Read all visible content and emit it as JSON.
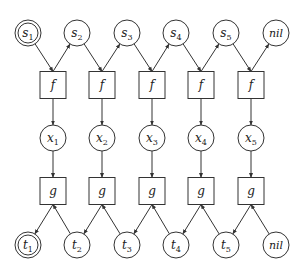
{
  "diagram": {
    "type": "factor-graph",
    "top_row": [
      {
        "id": "s1",
        "label": "s",
        "sub": "1",
        "double": true
      },
      {
        "id": "s2",
        "label": "s",
        "sub": "2",
        "double": false
      },
      {
        "id": "s3",
        "label": "s",
        "sub": "3",
        "double": false
      },
      {
        "id": "s4",
        "label": "s",
        "sub": "4",
        "double": false
      },
      {
        "id": "s5",
        "label": "s",
        "sub": "5",
        "double": false
      },
      {
        "id": "nil_top",
        "label": "nil",
        "sub": "",
        "double": false
      }
    ],
    "f_boxes": [
      {
        "id": "f1",
        "label": "f"
      },
      {
        "id": "f2",
        "label": "f"
      },
      {
        "id": "f3",
        "label": "f"
      },
      {
        "id": "f4",
        "label": "f"
      },
      {
        "id": "f5",
        "label": "f"
      }
    ],
    "middle_row": [
      {
        "id": "x1",
        "label": "x",
        "sub": "1"
      },
      {
        "id": "x2",
        "label": "x",
        "sub": "2"
      },
      {
        "id": "x3",
        "label": "x",
        "sub": "3"
      },
      {
        "id": "x4",
        "label": "x",
        "sub": "4"
      },
      {
        "id": "x5",
        "label": "x",
        "sub": "5"
      }
    ],
    "g_boxes": [
      {
        "id": "g1",
        "label": "g"
      },
      {
        "id": "g2",
        "label": "g"
      },
      {
        "id": "g3",
        "label": "g"
      },
      {
        "id": "g4",
        "label": "g"
      },
      {
        "id": "g5",
        "label": "g"
      }
    ],
    "bottom_row": [
      {
        "id": "t1",
        "label": "t",
        "sub": "1",
        "double": true
      },
      {
        "id": "t2",
        "label": "t",
        "sub": "2",
        "double": false
      },
      {
        "id": "t3",
        "label": "t",
        "sub": "3",
        "double": false
      },
      {
        "id": "t4",
        "label": "t",
        "sub": "4",
        "double": false
      },
      {
        "id": "t5",
        "label": "t",
        "sub": "5",
        "double": false
      },
      {
        "id": "nil_bottom",
        "label": "nil",
        "sub": "",
        "double": false
      }
    ],
    "edges": [
      {
        "from": "s1",
        "to": "f1"
      },
      {
        "from": "f1",
        "to": "s2"
      },
      {
        "from": "s2",
        "to": "f2"
      },
      {
        "from": "f2",
        "to": "s3"
      },
      {
        "from": "s3",
        "to": "f3"
      },
      {
        "from": "f3",
        "to": "s4"
      },
      {
        "from": "s4",
        "to": "f4"
      },
      {
        "from": "f4",
        "to": "s5"
      },
      {
        "from": "s5",
        "to": "f5"
      },
      {
        "from": "f5",
        "to": "nil_top"
      },
      {
        "from": "f1",
        "to": "x1"
      },
      {
        "from": "f2",
        "to": "x2"
      },
      {
        "from": "f3",
        "to": "x3"
      },
      {
        "from": "f4",
        "to": "x4"
      },
      {
        "from": "f5",
        "to": "x5"
      },
      {
        "from": "x1",
        "to": "g1"
      },
      {
        "from": "x2",
        "to": "g2"
      },
      {
        "from": "x3",
        "to": "g3"
      },
      {
        "from": "x4",
        "to": "g4"
      },
      {
        "from": "x5",
        "to": "g5"
      },
      {
        "from": "g1",
        "to": "t1"
      },
      {
        "from": "t2",
        "to": "g1"
      },
      {
        "from": "g2",
        "to": "t2"
      },
      {
        "from": "t3",
        "to": "g2"
      },
      {
        "from": "g3",
        "to": "t3"
      },
      {
        "from": "t4",
        "to": "g3"
      },
      {
        "from": "g4",
        "to": "t4"
      },
      {
        "from": "t5",
        "to": "g4"
      },
      {
        "from": "g5",
        "to": "t5"
      },
      {
        "from": "nil_bottom",
        "to": "g5"
      }
    ]
  }
}
